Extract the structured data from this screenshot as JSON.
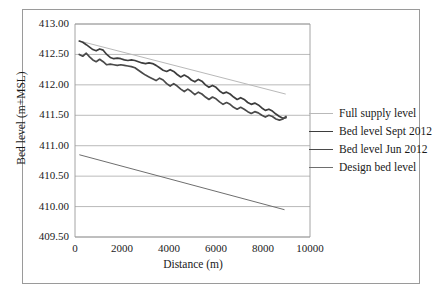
{
  "chart_data": {
    "type": "line",
    "title": "",
    "xlabel": "Distance (m)",
    "ylabel": "Bed level (m+MSL)",
    "xlim": [
      0,
      10000
    ],
    "ylim": [
      409.5,
      413.0
    ],
    "xticks": [
      0,
      2000,
      4000,
      6000,
      8000,
      10000
    ],
    "xtick_labels": [
      "0",
      "2000",
      "4000",
      "6000",
      "8000",
      "10000"
    ],
    "yticks": [
      409.5,
      410.0,
      410.5,
      411.0,
      411.5,
      412.0,
      412.5,
      413.0
    ],
    "ytick_labels": [
      "409.50",
      "410.00",
      "410.50",
      "411.00",
      "411.50",
      "412.00",
      "412.50",
      "413.00"
    ],
    "grid": "horizontal",
    "legend_position": "right",
    "series": [
      {
        "name": "Full supply level",
        "color": "#b9b9b9",
        "width": 1.0,
        "style": "straight",
        "x": [
          200,
          8950
        ],
        "y": [
          412.72,
          411.85
        ]
      },
      {
        "name": "Bed level Sept 2012",
        "color": "#3d3d3d",
        "width": 1.7,
        "style": "wiggly",
        "x": [
          180,
          330,
          480,
          620,
          760,
          900,
          1050,
          1200,
          1350,
          1500,
          1650,
          1800,
          1950,
          2100,
          2250,
          2400,
          2550,
          2700,
          2850,
          3000,
          3150,
          3300,
          3450,
          3600,
          3750,
          3900,
          4050,
          4200,
          4350,
          4500,
          4650,
          4800,
          4950,
          5100,
          5250,
          5400,
          5550,
          5700,
          5850,
          6000,
          6150,
          6300,
          6450,
          6600,
          6750,
          6900,
          7050,
          7200,
          7350,
          7500,
          7650,
          7800,
          7950,
          8100,
          8250,
          8400,
          8550,
          8700,
          8850,
          8980
        ],
        "y": [
          412.72,
          412.7,
          412.66,
          412.62,
          412.58,
          412.56,
          412.59,
          412.57,
          412.5,
          412.45,
          412.43,
          412.44,
          412.43,
          412.41,
          412.4,
          412.41,
          412.4,
          412.38,
          412.36,
          412.35,
          412.36,
          412.35,
          412.32,
          412.28,
          412.24,
          412.22,
          412.25,
          412.22,
          412.17,
          412.13,
          412.16,
          412.13,
          412.08,
          412.05,
          412.09,
          412.06,
          412.0,
          411.96,
          411.99,
          411.96,
          411.9,
          411.86,
          411.88,
          411.85,
          411.8,
          411.76,
          411.79,
          411.76,
          411.71,
          411.68,
          411.7,
          411.67,
          411.62,
          411.58,
          411.6,
          411.57,
          411.52,
          411.48,
          411.45,
          411.46
        ]
      },
      {
        "name": "Bed level Jun 2012",
        "color": "#4a4a4a",
        "width": 1.7,
        "style": "wiggly",
        "x": [
          180,
          330,
          480,
          620,
          760,
          900,
          1050,
          1200,
          1350,
          1500,
          1650,
          1800,
          1950,
          2100,
          2250,
          2400,
          2550,
          2700,
          2850,
          3000,
          3150,
          3300,
          3450,
          3600,
          3750,
          3900,
          4050,
          4200,
          4350,
          4500,
          4650,
          4800,
          4950,
          5100,
          5250,
          5400,
          5550,
          5700,
          5850,
          6000,
          6150,
          6300,
          6450,
          6600,
          6750,
          6900,
          7050,
          7200,
          7350,
          7500,
          7650,
          7800,
          7950,
          8100,
          8250,
          8400,
          8550,
          8700,
          8850,
          8980
        ],
        "y": [
          412.5,
          412.47,
          412.52,
          412.46,
          412.41,
          412.38,
          412.42,
          412.38,
          412.33,
          412.34,
          412.33,
          412.32,
          412.33,
          412.32,
          412.31,
          412.3,
          412.28,
          412.24,
          412.2,
          412.16,
          412.13,
          412.1,
          412.07,
          412.11,
          412.08,
          412.02,
          411.98,
          412.02,
          411.98,
          411.93,
          411.89,
          411.93,
          411.89,
          411.84,
          411.88,
          411.85,
          411.8,
          411.76,
          411.8,
          411.77,
          411.72,
          411.68,
          411.71,
          411.68,
          411.63,
          411.6,
          411.63,
          411.6,
          411.56,
          411.53,
          411.56,
          411.54,
          411.5,
          411.47,
          411.5,
          411.48,
          411.44,
          411.42,
          411.44,
          411.48
        ]
      },
      {
        "name": "Design bed level",
        "color": "#6e6e6e",
        "width": 1.0,
        "style": "straight",
        "x": [
          200,
          8900
        ],
        "y": [
          410.85,
          409.95
        ]
      }
    ]
  },
  "legend": {
    "items": [
      {
        "label": "Full supply level"
      },
      {
        "label": "Bed level Sept 2012"
      },
      {
        "label": "Bed level Jun 2012"
      },
      {
        "label": "Design bed level"
      }
    ]
  }
}
